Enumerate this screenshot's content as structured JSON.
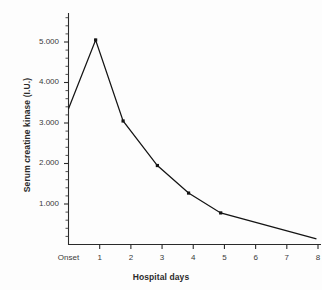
{
  "chart_data": {
    "type": "line",
    "title": "",
    "xlabel": "Hospital days",
    "ylabel": "Serum creatine kinase (I.U.)",
    "x_categories": [
      "Onset",
      "1",
      "2",
      "3",
      "4",
      "5",
      "6",
      "7",
      "8"
    ],
    "x_tick_labels": [
      "Onset",
      "1",
      "2",
      "3",
      "4",
      "5",
      "6",
      "7",
      "8"
    ],
    "y_tick_labels": [
      "1.000",
      "2.000",
      "3.000",
      "4.000",
      "5.000"
    ],
    "y_tick_values": [
      1000,
      2000,
      3000,
      4000,
      5000
    ],
    "ylim": [
      0,
      5800
    ],
    "xlim": [
      -0.15,
      8.15
    ],
    "grid": false,
    "legend": false,
    "minor_ticks": true,
    "minor_tick_step": 200,
    "series": [
      {
        "name": "Serum creatine kinase",
        "marker": "square",
        "color": "#141414",
        "points": [
          {
            "x_label": "Onset",
            "x": 0.0,
            "y": 3350
          },
          {
            "x_label": "1",
            "x": 0.87,
            "y": 5050
          },
          {
            "x_label": "2",
            "x": 1.75,
            "y": 3050
          },
          {
            "x_label": "3",
            "x": 2.85,
            "y": 1950
          },
          {
            "x_label": "4",
            "x": 3.85,
            "y": 1270
          },
          {
            "x_label": "5",
            "x": 4.88,
            "y": 780
          },
          {
            "x_label": "8",
            "x": 7.95,
            "y": 140
          }
        ]
      }
    ]
  },
  "axes": {
    "x_title": "Hospital days",
    "y_title": "Serum creatine kinase (I.U.)"
  }
}
